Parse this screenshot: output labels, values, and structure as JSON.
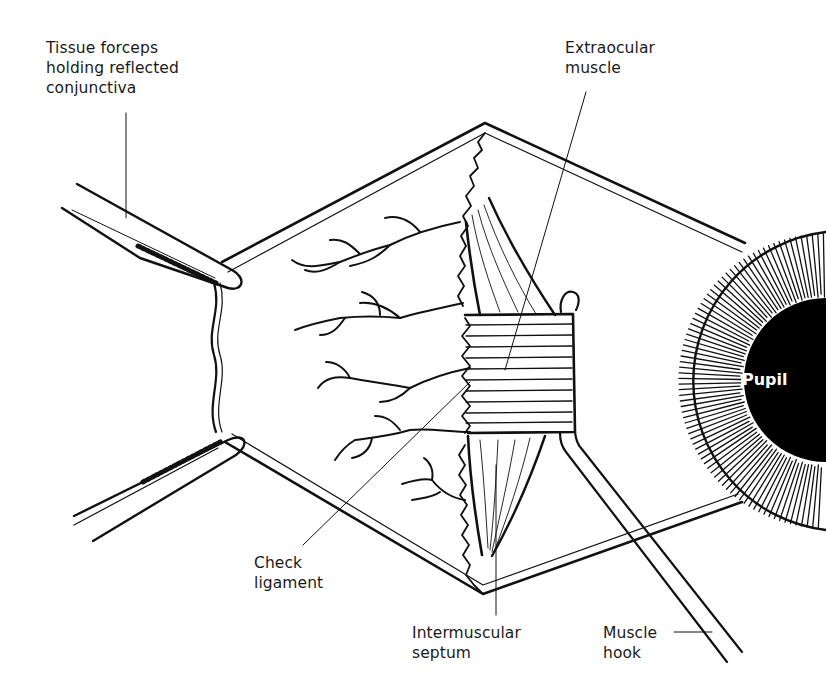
{
  "figure": {
    "colors": {
      "ink": "#111111",
      "label": "#1a1a1a",
      "background": "#ffffff",
      "pupil_text": "#ffffff"
    }
  },
  "labels": {
    "tissue_forceps": "Tissue forceps\nholding reflected\nconjunctiva",
    "extraocular_muscle": "Extraocular\nmuscle",
    "check_ligament": "Check\nligament",
    "intermuscular_septum": "Intermuscular\nseptum",
    "muscle_hook": "Muscle\nhook",
    "pupil": "Pupil"
  },
  "structures": [
    "conjunctiva-flap",
    "tissue-forceps-upper",
    "tissue-forceps-lower",
    "blood-vessels",
    "extraocular-muscle",
    "muscle-hook",
    "iris",
    "pupil"
  ]
}
